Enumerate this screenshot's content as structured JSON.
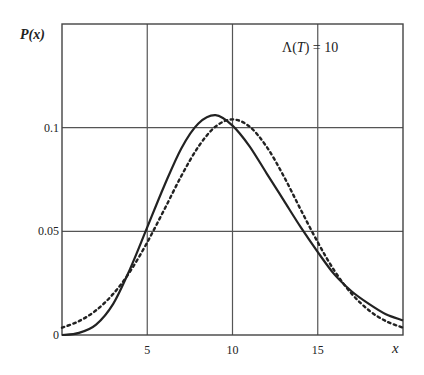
{
  "chart_data": {
    "type": "line",
    "title": "",
    "annotation": "Λ(T) = 10",
    "annotation_parts": {
      "lambda": "Λ(",
      "T": "T",
      "rest": ") = 10"
    },
    "xlabel": "x",
    "ylabel": "P(x)",
    "xlim": [
      0,
      20
    ],
    "ylim": [
      0,
      0.15
    ],
    "grid": true,
    "legend": "none",
    "x_ticks": [
      {
        "value": 0,
        "label": ""
      },
      {
        "value": 5,
        "label": "5"
      },
      {
        "value": 10,
        "label": "10"
      },
      {
        "value": 15,
        "label": "15"
      }
    ],
    "y_ticks": [
      {
        "value": 0,
        "label": "0"
      },
      {
        "value": 0.05,
        "label": "0.05"
      },
      {
        "value": 0.1,
        "label": "0.1"
      }
    ],
    "x": [
      0,
      1,
      2,
      3,
      4,
      5,
      6,
      7,
      8,
      9,
      10,
      11,
      12,
      13,
      14,
      15,
      16,
      17,
      18,
      19,
      20
    ],
    "series": [
      {
        "name": "solid",
        "style": "solid",
        "values": [
          0.0,
          0.001,
          0.005,
          0.015,
          0.032,
          0.052,
          0.072,
          0.09,
          0.102,
          0.106,
          0.101,
          0.091,
          0.078,
          0.065,
          0.052,
          0.04,
          0.029,
          0.021,
          0.015,
          0.01,
          0.007
        ]
      },
      {
        "name": "dotted",
        "style": "dotted",
        "values": [
          0.0035,
          0.0067,
          0.0119,
          0.0198,
          0.0307,
          0.0447,
          0.0605,
          0.0767,
          0.0908,
          0.1005,
          0.104,
          0.1005,
          0.0908,
          0.0767,
          0.0605,
          0.0447,
          0.0307,
          0.0198,
          0.0119,
          0.0067,
          0.0035
        ]
      }
    ]
  }
}
